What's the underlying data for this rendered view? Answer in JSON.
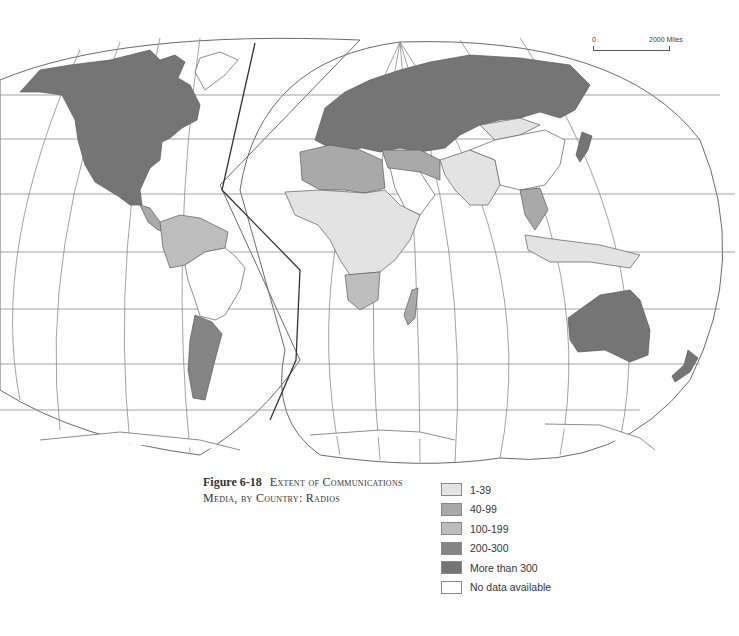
{
  "figure": {
    "number": "Figure 6-18",
    "title": "Extent of Communications Media, by Country: Radios"
  },
  "scale_bar": {
    "start_label": "0",
    "end_label": "2000 Miles"
  },
  "legend": {
    "items": [
      {
        "label": "1-39",
        "color": "#e3e3e3"
      },
      {
        "label": "40-99",
        "color": "#a9a9a9"
      },
      {
        "label": "100-199",
        "color": "#bdbdbd"
      },
      {
        "label": "200-300",
        "color": "#858585"
      },
      {
        "label": "More than 300",
        "color": "#757575"
      },
      {
        "label": "No data available",
        "color": "#ffffff"
      }
    ]
  },
  "map": {
    "projection": "interrupted world map (two lobes)",
    "regions": [
      {
        "name": "North America (USA, Canada, Mexico)",
        "class": "More than 300"
      },
      {
        "name": "Central America",
        "class": "40-99"
      },
      {
        "name": "Northern South America",
        "class": "100-199"
      },
      {
        "name": "Argentina",
        "class": "200-300"
      },
      {
        "name": "Uruguay",
        "class": "200-300"
      },
      {
        "name": "Brazil",
        "class": "No data available"
      },
      {
        "name": "Europe",
        "class": "More than 300"
      },
      {
        "name": "Soviet Union",
        "class": "More than 300"
      },
      {
        "name": "North Africa",
        "class": "40-99"
      },
      {
        "name": "Middle East (Iran, Turkey)",
        "class": "40-99"
      },
      {
        "name": "Sub-Saharan Africa",
        "class": "1-39"
      },
      {
        "name": "South Africa",
        "class": "100-199"
      },
      {
        "name": "Madagascar",
        "class": "40-99"
      },
      {
        "name": "South Asia (India, Pakistan)",
        "class": "1-39"
      },
      {
        "name": "Mongolia",
        "class": "1-39"
      },
      {
        "name": "China",
        "class": "No data available"
      },
      {
        "name": "Japan",
        "class": "More than 300"
      },
      {
        "name": "Southeast Asia",
        "class": "40-99"
      },
      {
        "name": "Indonesia / New Guinea",
        "class": "1-39"
      },
      {
        "name": "Australia",
        "class": "More than 300"
      },
      {
        "name": "New Zealand",
        "class": "More than 300"
      }
    ]
  }
}
